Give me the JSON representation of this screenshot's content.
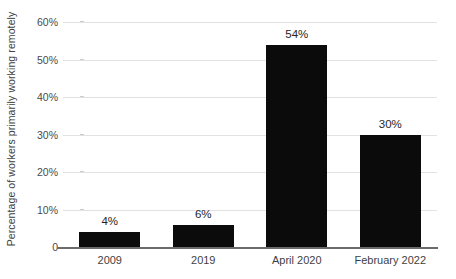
{
  "chart_data": {
    "type": "bar",
    "title": "",
    "xlabel": "",
    "ylabel": "Percentage of workers primarily working remotely",
    "categories": [
      "2009",
      "2019",
      "April 2020",
      "February 2022"
    ],
    "values": [
      4,
      6,
      54,
      30
    ],
    "value_labels": [
      "4%",
      "6%",
      "54%",
      "30%"
    ],
    "ylim": [
      0,
      60
    ],
    "ytick_values": [
      60,
      50,
      40,
      30,
      20,
      10,
      0
    ],
    "ytick_labels": [
      "60%",
      "50%",
      "40%",
      "30%",
      "20%",
      "10%",
      "0"
    ],
    "grid": true,
    "legend": false,
    "bar_color": "#0b0b0b",
    "gridline_color": "#e2e2e2",
    "axis_color": "#6b6b6b",
    "label_color": "#262626"
  }
}
